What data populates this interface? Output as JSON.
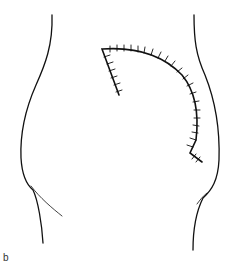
{
  "figure": {
    "panel_label": "b",
    "colors": {
      "line": "#111111",
      "background": "#ffffff"
    },
    "elements": [
      "left-body-contour",
      "left-gluteal-fold",
      "right-body-contour",
      "right-gluteal-fold",
      "sutured-incision"
    ]
  }
}
